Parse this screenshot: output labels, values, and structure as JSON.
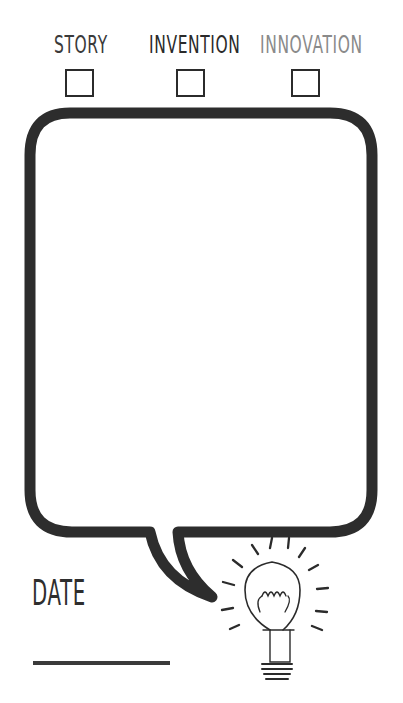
{
  "categories": [
    {
      "label": "STORY",
      "color": "#3a3a3a",
      "checked": false
    },
    {
      "label": "INVENTION",
      "color": "#2a2a2a",
      "checked": false
    },
    {
      "label": "INNOVATION",
      "color": "#8a8a8a",
      "checked": false
    }
  ],
  "speech_bubble": {
    "content": "",
    "stroke_color": "#2d2d2d"
  },
  "date": {
    "label": "DATE",
    "value": ""
  },
  "illustration": {
    "icon": "lightbulb-icon"
  }
}
